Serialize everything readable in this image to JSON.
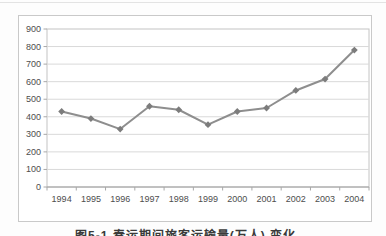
{
  "page": {
    "background": "#fdfdfd",
    "top_rule_color": "#e3e3e3"
  },
  "figure": {
    "border_color": "#c9c9c9",
    "background": "#ffffff"
  },
  "caption": {
    "text": "图5-1 春运期间旅客运输量(万人) 变化"
  },
  "chart_data": {
    "type": "line",
    "title": "",
    "xlabel": "",
    "ylabel": "",
    "categories": [
      "1994",
      "1995",
      "1996",
      "1997",
      "1998",
      "1999",
      "2000",
      "2001",
      "2002",
      "2003",
      "2004"
    ],
    "series": [
      {
        "name": "",
        "values": [
          430,
          390,
          330,
          460,
          440,
          355,
          430,
          450,
          550,
          615,
          780
        ]
      }
    ],
    "ylim": [
      0,
      900
    ],
    "ytick_step": 100,
    "yticks": [
      0,
      100,
      200,
      300,
      400,
      500,
      600,
      700,
      800,
      900
    ],
    "grid": true,
    "legend": false,
    "marker": "diamond",
    "colors": {
      "line": "#8e8e8e",
      "marker": "#7c7c7c",
      "gridline": "#d9d9d9",
      "plot_border": "#c4c4c4",
      "axis": "#a0a0a0",
      "tick": "#a8a8a8",
      "tick_label": "#4d4d4d"
    }
  }
}
